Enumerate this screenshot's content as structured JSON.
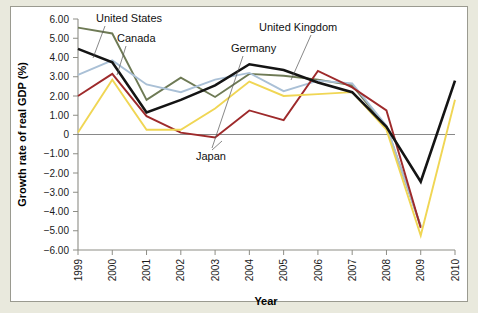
{
  "figure": {
    "background_color": "#e9e9dd",
    "plate_color": "#ffffff"
  },
  "chart_data": {
    "type": "line",
    "title": "",
    "xlabel": "Year",
    "ylabel": "Growth rate of real GDP (%)",
    "categories": [
      "1999",
      "2000",
      "2001",
      "2002",
      "2003",
      "2004",
      "2005",
      "2006",
      "2007",
      "2008",
      "2009",
      "2010"
    ],
    "x": [
      1999,
      2000,
      2001,
      2002,
      2003,
      2004,
      2005,
      2006,
      2007,
      2008,
      2009,
      2010
    ],
    "xlim": [
      1999,
      2010
    ],
    "ylim": [
      -6.0,
      6.0
    ],
    "ytick_labels": [
      "6.00",
      "5.00",
      "4.00",
      "3.00",
      "2.00",
      "1.00",
      "0",
      "−1.00",
      "−2.00",
      "−3.00",
      "−4.00",
      "−5.00",
      "−6.00"
    ],
    "yticks": [
      6,
      5,
      4,
      3,
      2,
      1,
      0,
      -1,
      -2,
      -3,
      -4,
      -5,
      -6
    ],
    "grid": false,
    "zero_line": true,
    "legend_position": "inline-annotations",
    "series": [
      {
        "name": "Canada",
        "color": "#6e7a55",
        "values": [
          5.55,
          5.25,
          1.8,
          2.95,
          1.95,
          3.15,
          3.05,
          2.85,
          2.55,
          0.4,
          -4.75,
          null
        ]
      },
      {
        "name": "United States",
        "color": "#141414",
        "values": [
          4.45,
          3.75,
          1.15,
          1.8,
          2.55,
          3.65,
          3.35,
          2.7,
          2.2,
          0.4,
          -2.45,
          2.8
        ]
      },
      {
        "name": "United Kingdom",
        "color": "#aac0d6",
        "values": [
          3.1,
          3.85,
          2.6,
          2.2,
          2.85,
          3.2,
          2.25,
          2.8,
          2.65,
          0.45,
          -4.8,
          null
        ]
      },
      {
        "name": "Germany",
        "color": "#9e2a2b",
        "values": [
          2.0,
          3.15,
          0.95,
          0.1,
          -0.15,
          1.25,
          0.75,
          3.3,
          2.45,
          1.25,
          -4.85,
          null
        ]
      },
      {
        "name": "Japan",
        "color": "#f0d654",
        "values": [
          0.1,
          2.85,
          0.25,
          0.25,
          1.35,
          2.75,
          2.0,
          2.1,
          2.2,
          0.25,
          -5.25,
          1.8
        ]
      }
    ],
    "annotations": [
      {
        "label": "United States",
        "series": "United States"
      },
      {
        "label": "Canada",
        "series": "Canada"
      },
      {
        "label": "Germany",
        "series": "Germany"
      },
      {
        "label": "United Kingdom",
        "series": "United Kingdom"
      },
      {
        "label": "Japan",
        "series": "Japan"
      }
    ]
  }
}
